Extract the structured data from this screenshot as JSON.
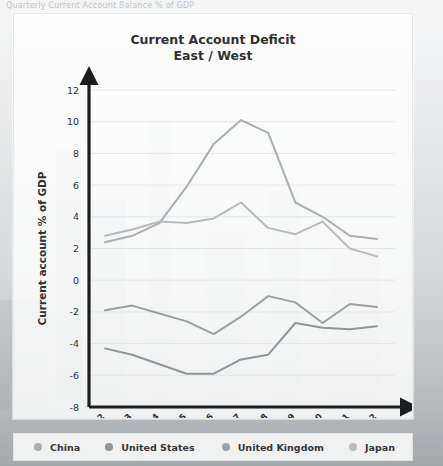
{
  "page": {
    "top_strip_text": "Quarterly Current Account Balance % of GDP"
  },
  "card": {
    "title": "Current Account Deficit",
    "subtitle": "East / West"
  },
  "legend": {
    "items": [
      {
        "label": "China",
        "color": "#a9aeb2"
      },
      {
        "label": "United States",
        "color": "#90959a"
      },
      {
        "label": "United Kingdom",
        "color": "#9aa0a4"
      },
      {
        "label": "Japan",
        "color": "#b6babe"
      }
    ]
  },
  "chart_data": {
    "type": "line",
    "title": "Current Account Deficit",
    "subtitle": "East / West",
    "xlabel": "",
    "ylabel": "Current account % of GDP",
    "x": [
      "2002",
      "2003",
      "2004",
      "2005",
      "2006",
      "2007",
      "2008",
      "2009",
      "2010",
      "2011",
      "2012"
    ],
    "ylim": [
      -8,
      12
    ],
    "yticks": [
      -8,
      -6,
      -4,
      -2,
      0,
      2,
      4,
      6,
      8,
      10,
      12
    ],
    "ytick_labels": [
      "-8",
      "-6",
      "-4",
      "-2",
      "0",
      "2",
      "4",
      "6",
      "8",
      "10",
      "12"
    ],
    "grid": true,
    "legend_position": "bottom",
    "series": [
      {
        "name": "China",
        "color": "#a9aeb2",
        "values": [
          2.4,
          2.8,
          3.6,
          5.9,
          8.6,
          10.1,
          9.3,
          4.9,
          4.0,
          2.8,
          2.6
        ]
      },
      {
        "name": "United States",
        "color": "#90959a",
        "values": [
          -4.3,
          -4.7,
          -5.3,
          -5.9,
          -5.9,
          -5.0,
          -4.7,
          -2.7,
          -3.0,
          -3.1,
          -2.9
        ]
      },
      {
        "name": "United Kingdom",
        "color": "#9aa0a4",
        "values": [
          -1.9,
          -1.6,
          -2.1,
          -2.6,
          -3.4,
          -2.3,
          -1.0,
          -1.4,
          -2.7,
          -1.5,
          -1.7
        ]
      },
      {
        "name": "Japan",
        "color": "#b6babe",
        "values": [
          2.8,
          3.2,
          3.7,
          3.6,
          3.9,
          4.9,
          3.3,
          2.9,
          3.7,
          2.0,
          1.5
        ]
      }
    ]
  }
}
